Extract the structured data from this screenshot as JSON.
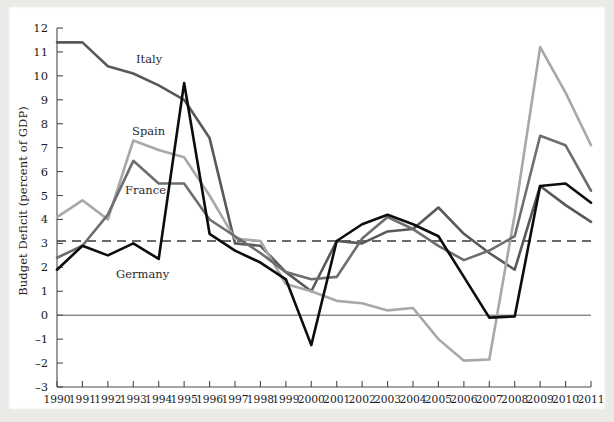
{
  "figure": {
    "background_color": "#eceae7",
    "plate_color": "#ffffff"
  },
  "axis": {
    "ylabel": "Budget Deficit (percent of GDP)",
    "xlabel": "",
    "y_ticks": [
      "12",
      "11",
      "10",
      "9",
      "8",
      "7",
      "6",
      "5",
      "4",
      "3",
      "2",
      "1",
      "0",
      "–1",
      "–2",
      "–3"
    ],
    "x_ticks": [
      "1990",
      "1991",
      "1992",
      "1993",
      "1994",
      "1995",
      "1996",
      "1997",
      "1998",
      "1999",
      "2000",
      "2001",
      "2002",
      "2003",
      "2004",
      "2005",
      "2006",
      "2007",
      "2008",
      "2009",
      "2010",
      "2011"
    ]
  },
  "reference_lines": {
    "zero_line_value": 0,
    "zero_line_color": "#555555",
    "threshold_line_value": 3.1,
    "threshold_line_color": "#3a3a3a",
    "threshold_line_style": "dashed"
  },
  "series_labels": [
    {
      "name": "Italy",
      "x": 128,
      "y": 57
    },
    {
      "name": "Spain",
      "x": 124,
      "y": 129
    },
    {
      "name": "France",
      "x": 117,
      "y": 188
    },
    {
      "name": "Germany",
      "x": 108,
      "y": 272
    }
  ],
  "chart_data": {
    "type": "line",
    "title": "",
    "xlabel": "",
    "ylabel": "Budget Deficit (percent of GDP)",
    "xlim": [
      1990,
      2011
    ],
    "ylim": [
      -3,
      12
    ],
    "grid": false,
    "legend": "inline-labels",
    "x": [
      1990,
      1991,
      1992,
      1993,
      1994,
      1995,
      1996,
      1997,
      1998,
      1999,
      2000,
      2001,
      2002,
      2003,
      2004,
      2005,
      2006,
      2007,
      2008,
      2009,
      2010,
      2011
    ],
    "series": [
      {
        "name": "Italy",
        "color": "#595959",
        "width": 2.6,
        "values": [
          11.4,
          11.4,
          10.4,
          10.1,
          9.6,
          9.0,
          7.4,
          3.0,
          2.9,
          1.8,
          1.0,
          3.1,
          3.0,
          3.5,
          3.6,
          4.5,
          3.4,
          2.6,
          1.9,
          5.4,
          4.6,
          3.9
        ]
      },
      {
        "name": "Spain",
        "color": "#a8a8a8",
        "width": 2.6,
        "values": [
          4.1,
          4.8,
          4.0,
          7.3,
          6.9,
          6.6,
          5.0,
          3.2,
          3.1,
          1.3,
          1.0,
          0.6,
          0.5,
          0.2,
          0.3,
          -1.0,
          -1.9,
          -1.85,
          4.2,
          11.2,
          9.3,
          7.1
        ]
      },
      {
        "name": "France",
        "color": "#6e6e6e",
        "width": 2.6,
        "values": [
          2.4,
          2.9,
          4.2,
          6.45,
          5.5,
          5.5,
          4.0,
          3.3,
          2.6,
          1.8,
          1.5,
          1.6,
          3.2,
          4.1,
          3.6,
          2.9,
          2.3,
          2.7,
          3.3,
          7.5,
          7.1,
          5.2
        ]
      },
      {
        "name": "Germany",
        "color": "#0d0d0d",
        "width": 2.6,
        "values": [
          1.9,
          2.9,
          2.5,
          3.0,
          2.35,
          9.7,
          3.4,
          2.7,
          2.2,
          1.5,
          -1.25,
          3.1,
          3.8,
          4.2,
          3.8,
          3.3,
          1.6,
          -0.1,
          -0.05,
          5.4,
          5.5,
          4.7
        ]
      }
    ]
  }
}
